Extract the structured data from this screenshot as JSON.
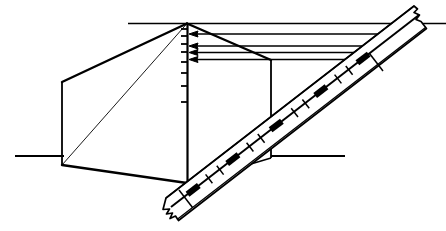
{
  "figure": {
    "width": 446,
    "height": 231,
    "background_color": "#ffffff",
    "ink_color": "#000000",
    "stroke_widths": {
      "heavy": 2.4,
      "medium": 1.6,
      "light": 0.9,
      "hairline": 0.8
    },
    "elements": {
      "horizon_line_label": "upper horizontal reference line",
      "ground_line_left_label": "left horizontal ground line",
      "ground_line_right_label": "right horizontal ground line",
      "box_label": "perspective box outline",
      "box_diagonal_label": "box interior diagonal",
      "vertical_scale_label": "vertical graduated scale",
      "arrows_label": "horizontal ray arrows",
      "ruler_label": "diagonal graduated ruler",
      "ruler_tear_top_label": "torn upper ruler end",
      "ruler_tear_bottom_label": "torn lower ruler end",
      "ruler_perpendicular_label": "perpendicular index tick on ruler"
    }
  },
  "geometry": {
    "horizon_line": {
      "x1": 128,
      "y1": 24,
      "x2": 446,
      "y2": 24
    },
    "ground_line_left": {
      "x1": 15,
      "y1": 156,
      "x2": 62,
      "y2": 156
    },
    "ground_line_right": {
      "x1": 272,
      "y1": 156,
      "x2": 345,
      "y2": 156
    },
    "vertical_scale": {
      "x": 187,
      "y_top": 23,
      "y_bottom": 183
    },
    "scale_ticks_y": [
      29,
      36,
      44,
      52,
      62,
      73,
      86,
      102,
      122,
      148,
      176
    ],
    "scale_tick_length": 7,
    "box": {
      "apex_top": {
        "x": 187,
        "y": 23
      },
      "apex_bottom": {
        "x": 187,
        "y": 183
      },
      "front_top_left": {
        "x": 62,
        "y": 82
      },
      "front_bottom_left": {
        "x": 62,
        "y": 165
      },
      "rear_top_right": {
        "x": 271,
        "y": 60
      },
      "rear_bottom_right": {
        "x": 271,
        "y": 158
      }
    },
    "arrows": [
      {
        "from_x": 375,
        "to_x": 192,
        "y": 34
      },
      {
        "from_x": 375,
        "to_x": 192,
        "y": 46
      },
      {
        "from_x": 355,
        "to_x": 192,
        "y": 52
      },
      {
        "from_x": 352,
        "to_x": 192,
        "y": 59
      }
    ],
    "ruler": {
      "axis_start": {
        "x": 172,
        "y": 206
      },
      "axis_end": {
        "x": 420,
        "y": 14
      },
      "band_halfwidth": 11,
      "black_segment_positions": [
        0.115,
        0.275,
        0.45,
        0.63,
        0.8
      ],
      "black_segment_length": 0.045,
      "minor_tick_positions": [
        0.195,
        0.24,
        0.36,
        0.405,
        0.54,
        0.585,
        0.715,
        0.76
      ]
    }
  }
}
